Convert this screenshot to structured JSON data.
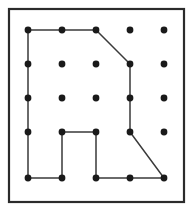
{
  "figure": {
    "background_color": "#ffffff",
    "frame": {
      "x": 9,
      "y": 9,
      "width": 175,
      "height": 193,
      "stroke_color": "#2b2b2b",
      "stroke_width": 2.2,
      "fill_color": "#ffffff"
    },
    "lattice": {
      "columns": 5,
      "rows": 5,
      "column_x": [
        28,
        62,
        96,
        130,
        164
      ],
      "row_y": [
        30,
        64,
        98,
        132,
        178
      ],
      "dot_radius": 3.4,
      "dot_color": "#1a1a1a"
    },
    "polygon": {
      "stroke_color": "#3a3a3a",
      "stroke_width": 1.5,
      "closed": true,
      "vertices": [
        {
          "col": 0,
          "row": 0,
          "x": 28,
          "y": 30
        },
        {
          "col": 2,
          "row": 0,
          "x": 96,
          "y": 30
        },
        {
          "col": 3,
          "row": 1,
          "x": 130,
          "y": 64
        },
        {
          "col": 3,
          "row": 3,
          "x": 130,
          "y": 132
        },
        {
          "col": 4,
          "row": 4,
          "x": 164,
          "y": 178
        },
        {
          "col": 2,
          "row": 4,
          "x": 96,
          "y": 178
        },
        {
          "col": 2,
          "row": 3,
          "x": 96,
          "y": 132
        },
        {
          "col": 1,
          "row": 3,
          "x": 62,
          "y": 132
        },
        {
          "col": 1,
          "row": 4,
          "x": 62,
          "y": 178
        },
        {
          "col": 0,
          "row": 4,
          "x": 28,
          "y": 178
        }
      ],
      "path_d": "M 28 30 L 96 30 L 130 64 L 130 132 L 164 178 L 96 178 L 96 132 L 62 132 L 62 178 L 28 178 Z"
    },
    "dots": [
      {
        "x": 28,
        "y": 30
      },
      {
        "x": 62,
        "y": 30
      },
      {
        "x": 96,
        "y": 30
      },
      {
        "x": 130,
        "y": 30
      },
      {
        "x": 164,
        "y": 30
      },
      {
        "x": 28,
        "y": 64
      },
      {
        "x": 62,
        "y": 64
      },
      {
        "x": 96,
        "y": 64
      },
      {
        "x": 130,
        "y": 64
      },
      {
        "x": 164,
        "y": 64
      },
      {
        "x": 28,
        "y": 98
      },
      {
        "x": 62,
        "y": 98
      },
      {
        "x": 96,
        "y": 98
      },
      {
        "x": 130,
        "y": 98
      },
      {
        "x": 164,
        "y": 98
      },
      {
        "x": 28,
        "y": 132
      },
      {
        "x": 62,
        "y": 132
      },
      {
        "x": 96,
        "y": 132
      },
      {
        "x": 130,
        "y": 132
      },
      {
        "x": 164,
        "y": 132
      },
      {
        "x": 28,
        "y": 178
      },
      {
        "x": 62,
        "y": 178
      },
      {
        "x": 96,
        "y": 178
      },
      {
        "x": 130,
        "y": 178
      },
      {
        "x": 164,
        "y": 178
      }
    ]
  }
}
